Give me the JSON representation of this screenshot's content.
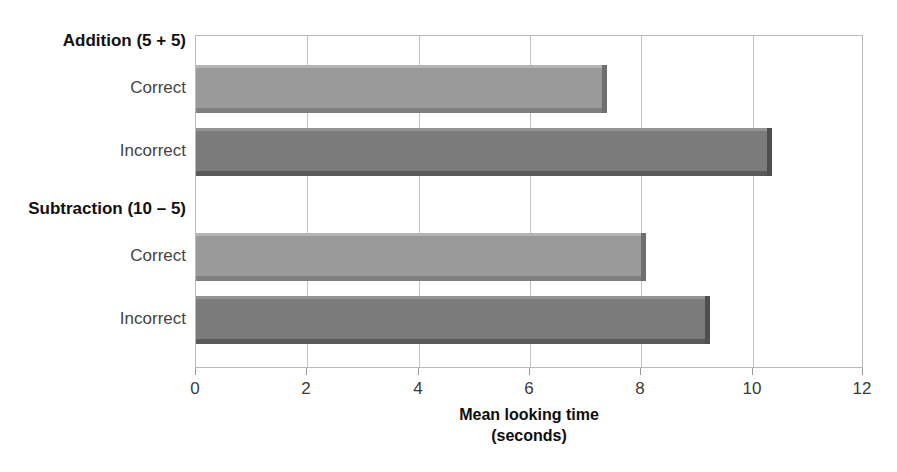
{
  "chart_data": {
    "type": "bar",
    "orientation": "horizontal",
    "title": "",
    "xlabel": "Mean looking time (seconds)",
    "xlabel_line1": "Mean looking time",
    "xlabel_line2": "(seconds)",
    "ylabel": "",
    "xlim": [
      0,
      12
    ],
    "xticks": [
      0,
      2,
      4,
      6,
      8,
      10,
      12
    ],
    "xtick_labels": [
      "0",
      "2",
      "4",
      "6",
      "8",
      "10",
      "12"
    ],
    "grid": "vertical",
    "legend": "none",
    "groups": [
      {
        "label": "Addition (5 + 5)",
        "categories": [
          "Correct",
          "Incorrect"
        ],
        "values": [
          7.3,
          10.25
        ]
      },
      {
        "label": "Subtraction (10 – 5)",
        "categories": [
          "Correct",
          "Incorrect"
        ],
        "values": [
          8.0,
          9.15
        ]
      }
    ],
    "categories": [
      "Addition (5 + 5) Correct",
      "Addition (5 + 5) Incorrect",
      "Subtraction (10 – 5) Correct",
      "Subtraction (10 – 5) Incorrect"
    ],
    "values": [
      7.3,
      10.25,
      8.0,
      9.15
    ],
    "bars": [
      {
        "group": "Addition (5 + 5)",
        "category": "Correct",
        "value": 7.3,
        "shade": "light"
      },
      {
        "group": "Addition (5 + 5)",
        "category": "Incorrect",
        "value": 10.25,
        "shade": "dark"
      },
      {
        "group": "Subtraction (10 – 5)",
        "category": "Correct",
        "value": 8.0,
        "shade": "light"
      },
      {
        "group": "Subtraction (10 – 5)",
        "category": "Incorrect",
        "value": 9.15,
        "shade": "dark"
      }
    ],
    "colors": {
      "bar_light": "#9a9a9a",
      "bar_dark": "#7b7b7b",
      "gridline": "#c4c4c4",
      "frame": "#b9b9b9",
      "text": "#444444",
      "group_text": "#111111",
      "background": "#ffffff"
    }
  },
  "labels": {
    "group_addition": "Addition (5 + 5)",
    "group_subtraction": "Subtraction (10 – 5)",
    "correct_1": "Correct",
    "incorrect_1": "Incorrect",
    "correct_2": "Correct",
    "incorrect_2": "Incorrect"
  },
  "xaxis": {
    "tick_0": "0",
    "tick_2": "2",
    "tick_4": "4",
    "tick_6": "6",
    "tick_8": "8",
    "tick_10": "10",
    "tick_12": "12",
    "title_line1": "Mean looking time",
    "title_line2": "(seconds)"
  }
}
